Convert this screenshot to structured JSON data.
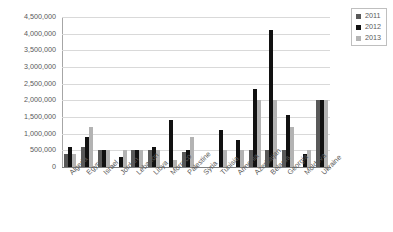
{
  "chart_data": {
    "type": "bar",
    "title": "",
    "subtitle": "",
    "xlabel": "",
    "ylabel": "",
    "ylim": [
      0,
      4500000
    ],
    "ytick_step": 500000,
    "grid": true,
    "legend_position": "top-right",
    "categories": [
      "Algeria",
      "Egypt",
      "Israel",
      "Jordan",
      "Lebanon",
      "Libya",
      "Morroco",
      "Palestine",
      "Syria",
      "Tunisia",
      "Armenia",
      "Azerbaijan",
      "Belarus",
      "Georgia",
      "Moldova",
      "Ukraine"
    ],
    "ytick_labels": [
      "4,500,000",
      "4,000,000",
      "3,500,000",
      "3,000,000",
      "2,500,000",
      "2,000,000",
      "1,500,000",
      "1,000,000",
      "500,000",
      "0"
    ],
    "ytick_values": [
      4500000,
      4000000,
      3500000,
      3000000,
      2500000,
      2000000,
      1500000,
      1000000,
      500000,
      0
    ],
    "series": [
      {
        "name": "2011",
        "color": "#595959",
        "values": [
          400000,
          600000,
          500000,
          0,
          500000,
          500000,
          0,
          450000,
          0,
          0,
          0,
          500000,
          500000,
          500000,
          0,
          2000000
        ]
      },
      {
        "name": "2012",
        "color": "#111111",
        "values": [
          600000,
          900000,
          500000,
          300000,
          500000,
          600000,
          1400000,
          500000,
          0,
          1100000,
          800000,
          2350000,
          4100000,
          1550000,
          400000,
          2000000
        ]
      },
      {
        "name": "2013",
        "color": "#b3b3b3",
        "values": [
          400000,
          1200000,
          500000,
          500000,
          500000,
          500000,
          200000,
          900000,
          0,
          500000,
          500000,
          2000000,
          2000000,
          1200000,
          500000,
          2000000
        ]
      }
    ]
  },
  "legend": {
    "items": [
      {
        "label": "2011",
        "color": "#595959"
      },
      {
        "label": "2012",
        "color": "#111111"
      },
      {
        "label": "2013",
        "color": "#b3b3b3"
      }
    ]
  }
}
